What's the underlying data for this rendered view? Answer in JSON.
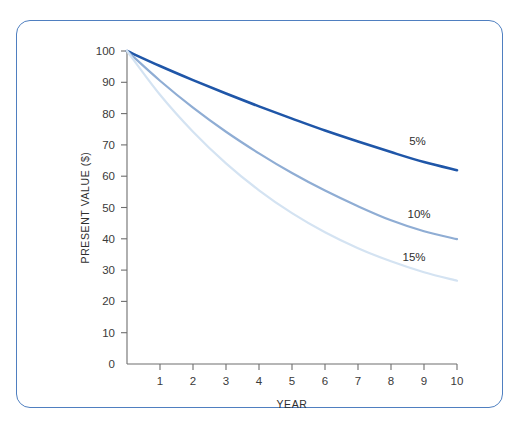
{
  "figure": {
    "border_color": "#4f7fc0",
    "background": "#ffffff"
  },
  "chart_data": {
    "type": "line",
    "title": "",
    "subtitle": "",
    "xlabel": "YEAR",
    "ylabel": "PRESENT VALUE ($)",
    "xlim": [
      0,
      10
    ],
    "ylim": [
      0,
      100
    ],
    "grid": false,
    "legend_position": "inline-right-of-curve-ends",
    "x_tick_labels": [
      "1",
      "2",
      "3",
      "4",
      "5",
      "6",
      "7",
      "8",
      "9",
      "10"
    ],
    "x_ticks": [
      1,
      2,
      3,
      4,
      5,
      6,
      7,
      8,
      9,
      10
    ],
    "y_tick_labels": [
      "0",
      "10",
      "20",
      "30",
      "40",
      "50",
      "60",
      "70",
      "80",
      "90",
      "100"
    ],
    "y_ticks": [
      0,
      10,
      20,
      30,
      40,
      50,
      60,
      70,
      80,
      90,
      100
    ],
    "x": [
      0,
      1,
      2,
      3,
      4,
      5,
      6,
      7,
      8,
      9,
      10
    ],
    "series": [
      {
        "name": "5%",
        "label": "5%",
        "color": "#1f56a8",
        "width": 2.6,
        "values": [
          100,
          95.2,
          90.7,
          86.4,
          82.3,
          78.4,
          74.6,
          71.1,
          67.7,
          64.5,
          61.9
        ],
        "label_x": 8.55,
        "label_y": 70.0
      },
      {
        "name": "10%",
        "label": "10%",
        "color": "#8fadd4",
        "width": 2.2,
        "values": [
          100,
          90.5,
          81.9,
          74.2,
          67.3,
          61.0,
          55.4,
          50.4,
          45.9,
          42.4,
          39.9
        ],
        "label_x": 8.5,
        "label_y": 46.5
      },
      {
        "name": "15%",
        "label": "15%",
        "color": "#d4e3f2",
        "width": 2.2,
        "values": [
          100,
          86.0,
          74.2,
          64.1,
          55.5,
          48.2,
          42.1,
          37.0,
          32.8,
          29.3,
          26.6
        ],
        "label_x": 8.35,
        "label_y": 33.0
      }
    ]
  }
}
